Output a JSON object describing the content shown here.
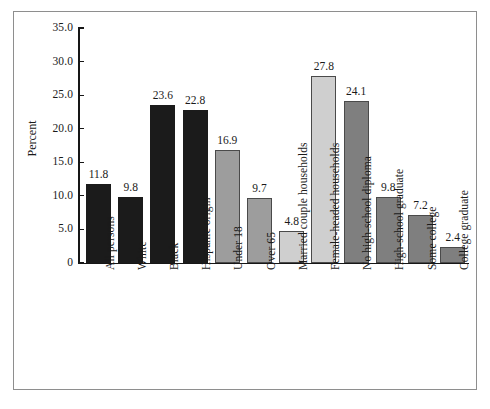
{
  "chart_data": {
    "type": "bar",
    "title": "",
    "subtitle": "",
    "xlabel": "",
    "ylabel": "Percent",
    "ylim": [
      0,
      35
    ],
    "grid": false,
    "legend": "none",
    "y_ticks": [
      "0",
      "5.0",
      "10.0",
      "15.0",
      "20.0",
      "25.0",
      "30.0",
      "35.0"
    ],
    "y_tick_values": [
      0,
      5,
      10,
      15,
      20,
      25,
      30,
      35
    ],
    "categories": [
      "All persons",
      "White",
      "Black",
      "Hispanic origin",
      "Under 18",
      "Over 65",
      "Married couple households",
      "Female-headed households",
      "No high-school diploma",
      "High-school graduate",
      "Some college",
      "College graduate"
    ],
    "values": [
      11.8,
      9.8,
      23.6,
      22.8,
      16.9,
      9.7,
      4.8,
      27.8,
      24.1,
      9.8,
      7.2,
      2.4
    ],
    "value_labels": [
      "11.8",
      "9.8",
      "23.6",
      "22.8",
      "16.9",
      "9.7",
      "4.8",
      "27.8",
      "24.1",
      "9.8",
      "7.2",
      "2.4"
    ],
    "bar_colors": [
      "#1b1b1b",
      "#1b1b1b",
      "#1b1b1b",
      "#1b1b1b",
      "#9d9d9d",
      "#9d9d9d",
      "#cfcfcf",
      "#cfcfcf",
      "#7f7f7f",
      "#7f7f7f",
      "#7f7f7f",
      "#7f7f7f"
    ],
    "groups": [
      {
        "name": "Race/ethnicity",
        "color": "#1b1b1b",
        "categories": [
          "All persons",
          "White",
          "Black",
          "Hispanic origin"
        ]
      },
      {
        "name": "Age",
        "color": "#9d9d9d",
        "categories": [
          "Under 18",
          "Over 65"
        ]
      },
      {
        "name": "Household type",
        "color": "#cfcfcf",
        "categories": [
          "Married couple households",
          "Female-headed households"
        ]
      },
      {
        "name": "Education",
        "color": "#7f7f7f",
        "categories": [
          "No high-school diploma",
          "High-school graduate",
          "Some college",
          "College graduate"
        ]
      }
    ]
  },
  "figure": {
    "frame_color": "#8e8e8e",
    "axis_color": "#161616",
    "background": "#ffffff"
  }
}
